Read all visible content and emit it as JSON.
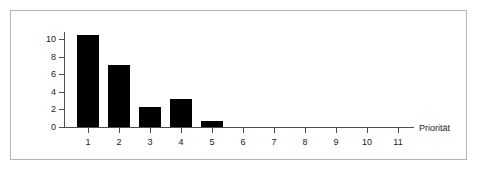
{
  "figure": {
    "background_color": "#ffffff",
    "frame_color": "#b4b4b4",
    "axis_color": "#4d4d4d",
    "bar_color": "#000000"
  },
  "chart_data": {
    "type": "bar",
    "title": "",
    "subtitle": "",
    "xlabel": "Priorität",
    "ylabel": "",
    "categories": [
      "1",
      "2",
      "3",
      "4",
      "5",
      "6",
      "7",
      "8",
      "9",
      "10",
      "11"
    ],
    "values": [
      10.4,
      7.1,
      2.3,
      3.2,
      0.7,
      0,
      0,
      0,
      0,
      0,
      0
    ],
    "series": [
      {
        "name": "Anzahl",
        "values": [
          10.4,
          7.1,
          2.3,
          3.2,
          0.7,
          0,
          0,
          0,
          0,
          0,
          0
        ]
      }
    ],
    "xtick_labels": [
      "1",
      "2",
      "3",
      "4",
      "5",
      "6",
      "7",
      "8",
      "9",
      "10",
      "11"
    ],
    "ytick_labels": [
      "0",
      "2",
      "4",
      "6",
      "8",
      "10"
    ],
    "ytick_values": [
      0,
      2,
      4,
      6,
      8,
      10
    ],
    "ylim": [
      0,
      11
    ],
    "xlim": [
      0.4,
      11.8
    ],
    "grid": false,
    "legend": false,
    "legend_position": "none"
  }
}
